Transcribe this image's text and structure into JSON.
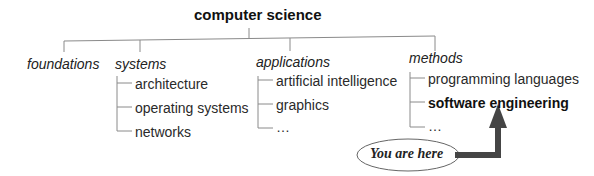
{
  "root": {
    "label": "computer science"
  },
  "categories": [
    {
      "label": "foundations",
      "children": []
    },
    {
      "label": "systems",
      "children": [
        "architecture",
        "operating systems",
        "networks"
      ]
    },
    {
      "label": "applications",
      "children": [
        "artificial intelligence",
        "graphics",
        "…"
      ]
    },
    {
      "label": "methods",
      "children": [
        "programming languages",
        "software engineering",
        "…"
      ]
    }
  ],
  "highlighted": "software engineering",
  "callout": {
    "label": "You are here"
  },
  "colors": {
    "line": "#888888",
    "arrow": "#444444",
    "text": "#222222"
  }
}
